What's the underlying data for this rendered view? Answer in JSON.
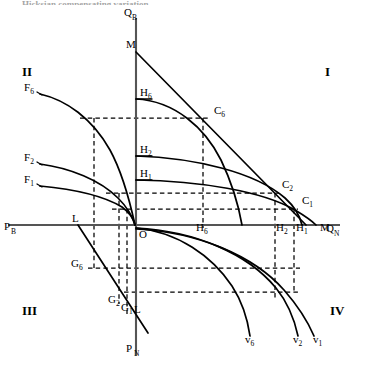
{
  "figure": {
    "clipped_title": "Hicksian compensating variation",
    "axes": {
      "q_b": "Q",
      "q_b_sub": "B",
      "q_n": "Q",
      "q_n_sub": "N",
      "p_b": "P",
      "p_b_sub": "B",
      "p_n": "P",
      "p_n_sub": "N",
      "origin": "O"
    },
    "quadrants": [
      {
        "name": "quadrant-1",
        "label": "I",
        "x": 325,
        "y": 76
      },
      {
        "name": "quadrant-2",
        "label": "II",
        "x": 22,
        "y": 76
      },
      {
        "name": "quadrant-3",
        "label": "III",
        "x": 22,
        "y": 315
      },
      {
        "name": "quadrant-4",
        "label": "IV",
        "x": 330,
        "y": 315
      }
    ],
    "labels": [
      {
        "name": "label-m-vertical",
        "base": "M",
        "sub": "",
        "x": 126,
        "y": 48
      },
      {
        "name": "label-m-horizontal",
        "base": "M",
        "sub": "",
        "x": 320,
        "y": 231
      },
      {
        "name": "label-h6-axis",
        "base": "H",
        "sub": "6",
        "x": 140,
        "y": 96
      },
      {
        "name": "label-h2-axis",
        "base": "H",
        "sub": "2",
        "x": 140,
        "y": 153
      },
      {
        "name": "label-h1-axis",
        "base": "H",
        "sub": "1",
        "x": 140,
        "y": 177
      },
      {
        "name": "label-c6",
        "base": "C",
        "sub": "6",
        "x": 214,
        "y": 114
      },
      {
        "name": "label-c2",
        "base": "C",
        "sub": "2",
        "x": 282,
        "y": 188
      },
      {
        "name": "label-c1",
        "base": "C",
        "sub": "1",
        "x": 302,
        "y": 204
      },
      {
        "name": "label-h6-base",
        "base": "H",
        "sub": "6",
        "x": 196,
        "y": 231
      },
      {
        "name": "label-h2-base",
        "base": "H",
        "sub": "2",
        "x": 276,
        "y": 231
      },
      {
        "name": "label-h1-base",
        "base": "H",
        "sub": "1",
        "x": 296,
        "y": 231
      },
      {
        "name": "label-f6",
        "base": "F",
        "sub": "6",
        "x": 24,
        "y": 91
      },
      {
        "name": "label-f2",
        "base": "F",
        "sub": "2",
        "x": 24,
        "y": 161
      },
      {
        "name": "label-f1",
        "base": "F",
        "sub": "1",
        "x": 24,
        "y": 183
      },
      {
        "name": "label-l-upper",
        "base": "L",
        "sub": "",
        "x": 72,
        "y": 222
      },
      {
        "name": "label-l-lower",
        "base": "L",
        "sub": "",
        "x": 134,
        "y": 313
      },
      {
        "name": "label-g6",
        "base": "G",
        "sub": "6",
        "x": 71,
        "y": 267
      },
      {
        "name": "label-g2",
        "base": "G",
        "sub": "2",
        "x": 108,
        "y": 303
      },
      {
        "name": "label-g1",
        "base": "G",
        "sub": "1",
        "x": 121,
        "y": 311
      },
      {
        "name": "label-v6",
        "base": "v",
        "sub": "6",
        "x": 245,
        "y": 343
      },
      {
        "name": "label-v2",
        "base": "v",
        "sub": "2",
        "x": 293,
        "y": 343
      },
      {
        "name": "label-v1",
        "base": "v",
        "sub": "1",
        "x": 313,
        "y": 343
      }
    ]
  },
  "chart_data": {
    "type": "line",
    "xlabel": "Q_N / P_B",
    "ylabel": "Q_B / P_N",
    "grid": false,
    "legend": "none",
    "origin_px": {
      "x": 136,
      "y": 225
    },
    "axis_ranges": {
      "q_n_axis_end_px": 340,
      "q_b_axis_top_px": 18,
      "p_b_axis_left_px": 8,
      "p_n_axis_bottom_px": 356
    },
    "quadrant_1": {
      "description": "Budget line M-M with three Hicksian indifference curves tangent at C6, C2, C1",
      "budget_line": {
        "from_px": [
          136,
          52
        ],
        "to_px": [
          306,
          225
        ],
        "label_top": "M",
        "label_right": "M"
      },
      "indifference_curves": [
        {
          "name": "H6",
          "intercept_y_px": 99,
          "tangency": "C6",
          "tangency_px": [
            206,
            118
          ],
          "foot_px": [
            203,
            225
          ]
        },
        {
          "name": "H2",
          "intercept_y_px": 156,
          "tangency": "C2",
          "tangency_px": [
            277,
            193
          ],
          "foot_px": [
            275,
            225
          ]
        },
        {
          "name": "H1",
          "intercept_y_px": 180,
          "tangency": "C1",
          "tangency_px": [
            296,
            209
          ],
          "foot_px": [
            294,
            225
          ]
        }
      ]
    },
    "quadrant_2": {
      "description": "Three concave transformation curves F6, F2, F1 falling toward the origin",
      "curves": [
        {
          "name": "F6",
          "start_px": [
            40,
            94
          ],
          "end_px": [
            136,
            225
          ]
        },
        {
          "name": "F2",
          "start_px": [
            40,
            164
          ],
          "end_px": [
            136,
            225
          ]
        },
        {
          "name": "F1",
          "start_px": [
            40,
            186
          ],
          "end_px": [
            136,
            225
          ]
        }
      ]
    },
    "quadrant_3": {
      "description": "Straight 45-degree style price ray L-L passing through G6, G2, G1",
      "ray": {
        "from_px": [
          78,
          225
        ],
        "to_px": [
          146,
          330
        ]
      },
      "points": [
        {
          "name": "G6",
          "px": [
            85,
            270
          ]
        },
        {
          "name": "G2",
          "px": [
            120,
            304
          ]
        },
        {
          "name": "G1",
          "px": [
            128,
            314
          ]
        }
      ]
    },
    "quadrant_4": {
      "description": "Three downward demand/valuation curves v6, v2, v1",
      "curves": [
        {
          "name": "v6",
          "from_px": [
            136,
            228
          ],
          "to_px": [
            250,
            336
          ]
        },
        {
          "name": "v2",
          "from_px": [
            136,
            228
          ],
          "to_px": [
            298,
            336
          ]
        },
        {
          "name": "v1",
          "from_px": [
            136,
            228
          ],
          "to_px": [
            316,
            336
          ]
        }
      ]
    },
    "projection_lines": {
      "style": "dashed",
      "horizontal_px": [
        118,
        157,
        177,
        200,
        268,
        288,
        299
      ],
      "vertical_px": [
        94,
        119,
        127,
        203,
        275,
        294
      ]
    }
  }
}
